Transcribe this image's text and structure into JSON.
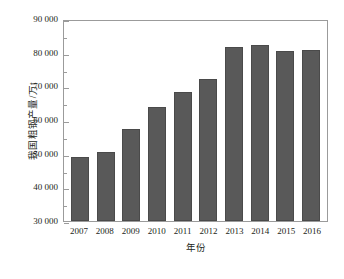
{
  "chart_data": {
    "type": "bar",
    "title": "",
    "subtitle": "",
    "xlabel": "年份",
    "ylabel": "我国粗钢产量/万t",
    "categories": [
      "2007",
      "2008",
      "2009",
      "2010",
      "2011",
      "2012",
      "2013",
      "2014",
      "2015",
      "2016"
    ],
    "values": [
      49000,
      50500,
      57200,
      63800,
      68400,
      72300,
      81600,
      82300,
      80400,
      80800
    ],
    "ylim": [
      30000,
      90000
    ],
    "y_major_ticks": [
      30000,
      40000,
      50000,
      60000,
      70000,
      80000,
      90000
    ],
    "y_tick_labels": [
      "30 000",
      "40 000",
      "50 000",
      "60 000",
      "70 000",
      "80 000",
      "90 000"
    ],
    "y_minor_step": 5000,
    "grid": false,
    "legend": false,
    "legend_position": "none",
    "bar_color": "#595959",
    "bar_edge_color": "#4a4a4a",
    "axis_color": "#9b9b9b",
    "series": [
      {
        "name": "我国粗钢产量",
        "values": [
          49000,
          50500,
          57200,
          63800,
          68400,
          72300,
          81600,
          82300,
          80400,
          80800
        ]
      }
    ]
  }
}
